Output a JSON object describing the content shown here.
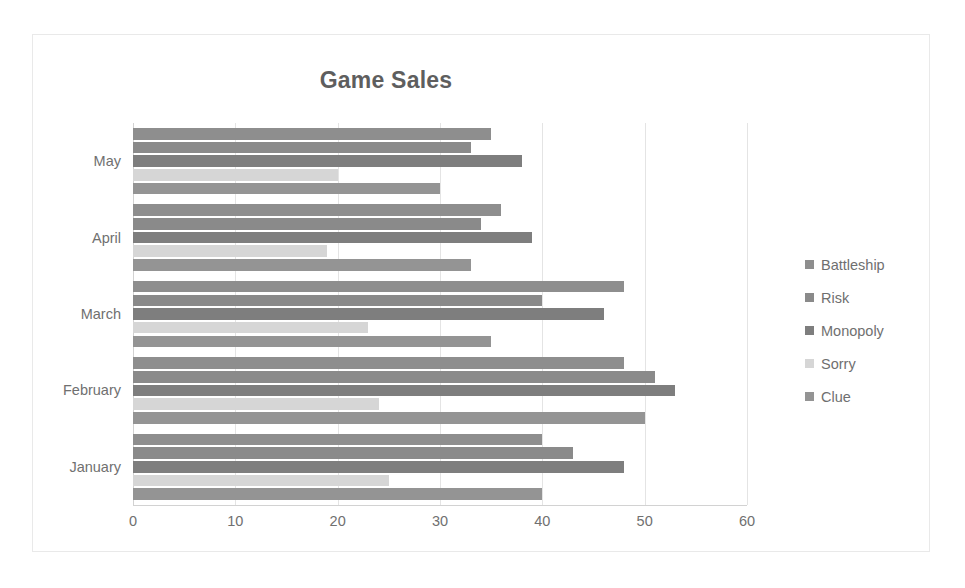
{
  "chart_data": {
    "type": "bar",
    "orientation": "horizontal",
    "title": "Game Sales",
    "xlabel": "",
    "ylabel": "",
    "xlim": [
      0,
      60
    ],
    "xticks": [
      0,
      10,
      20,
      30,
      40,
      50,
      60
    ],
    "xtick_labels": [
      "0",
      "10",
      "20",
      "30",
      "40",
      "50",
      "60"
    ],
    "grid": true,
    "legend_position": "right",
    "categories": [
      "May",
      "April",
      "March",
      "February",
      "January"
    ],
    "series": [
      {
        "name": "Battleship",
        "color": "#8e8e8e",
        "values": [
          35,
          36,
          48,
          48,
          40
        ]
      },
      {
        "name": "Risk",
        "color": "#8a8a8a",
        "values": [
          33,
          34,
          40,
          51,
          43
        ]
      },
      {
        "name": "Monopoly",
        "color": "#7e7e7e",
        "values": [
          38,
          39,
          46,
          53,
          48
        ]
      },
      {
        "name": "Sorry",
        "color": "#d6d6d6",
        "values": [
          20,
          19,
          23,
          24,
          25
        ]
      },
      {
        "name": "Clue",
        "color": "#949494",
        "values": [
          30,
          33,
          35,
          50,
          40
        ]
      }
    ]
  }
}
